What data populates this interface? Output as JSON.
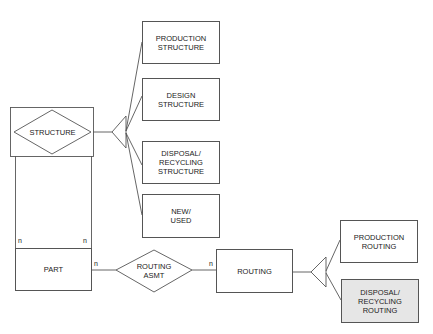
{
  "diagram": {
    "entities": {
      "structure": "STRUCTURE",
      "part": "PART",
      "routing_asmt": "ROUTING\nASMT",
      "routing": "ROUTING"
    },
    "structure_subtypes": [
      {
        "label": "PRODUCTION\nSTRUCTURE"
      },
      {
        "label": "DESIGN\nSTRUCTURE"
      },
      {
        "label": "DISPOSAL/\nRECYCLING\nSTRUCTURE"
      },
      {
        "label": "NEW/\nUSED"
      }
    ],
    "routing_subtypes": [
      {
        "label": "PRODUCTION\nROUTING",
        "shaded": false
      },
      {
        "label": "DISPOSAL/\nRECYCLING\nROUTING",
        "shaded": true
      }
    ],
    "cardinalities": {
      "structure_part_left": "n",
      "structure_part_right": "n",
      "part_routing_asmt": "n",
      "routing_asmt_routing": "n"
    },
    "colors": {
      "line": "#555555",
      "shaded_fill": "#e6e6e6",
      "text": "#222222"
    }
  }
}
